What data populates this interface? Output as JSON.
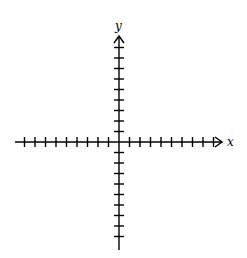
{
  "diagram": {
    "type": "cartesian-coordinate-axes",
    "x_axis": {
      "label": "x",
      "ticks_negative": 9,
      "ticks_positive": 9,
      "arrow_positive": true
    },
    "y_axis": {
      "label": "y",
      "ticks_positive": 9,
      "ticks_negative": 9,
      "arrow_positive": true
    },
    "colors": {
      "line": "#000000",
      "background": "#ffffff"
    }
  }
}
